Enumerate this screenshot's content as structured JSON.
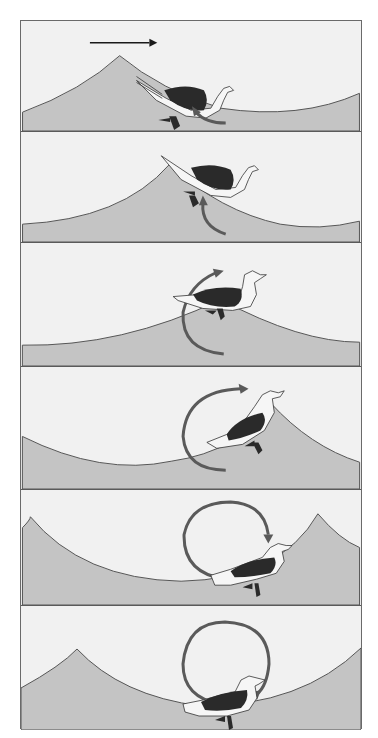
{
  "figure": {
    "colors": {
      "sky": "#f1f1f1",
      "water": "#c4c4c4",
      "wave_line": "#555555",
      "orbit_arrow": "#5a5a5a",
      "direction_arrow": "#1a1a1a",
      "bird_back": "#2a2a2a",
      "bird_body": "#f6f6f6",
      "border": "#5a5a5a"
    },
    "direction_arrow": {
      "panel": 1,
      "meaning": "wave travel direction",
      "points": "right"
    },
    "panels": [
      {
        "index": 1,
        "top": 0,
        "height": 111,
        "bird_position": "leeward slope past crest",
        "orbit_arc": "short arc at bottom right"
      },
      {
        "index": 2,
        "top": 111,
        "height": 111,
        "bird_position": "just below crest",
        "orbit_arc": "quarter arc rising"
      },
      {
        "index": 3,
        "top": 222,
        "height": 124,
        "bird_position": "at crest",
        "orbit_arc": "half circle on left"
      },
      {
        "index": 4,
        "top": 346,
        "height": 123,
        "bird_position": "windward slope descending",
        "orbit_arc": "three-quarter circle"
      },
      {
        "index": 5,
        "top": 469,
        "height": 116,
        "bird_position": "near trough",
        "orbit_arc": "nearly full circle"
      },
      {
        "index": 6,
        "top": 585,
        "height": 124,
        "bird_position": "in trough",
        "orbit_arc": "full circle"
      }
    ]
  }
}
